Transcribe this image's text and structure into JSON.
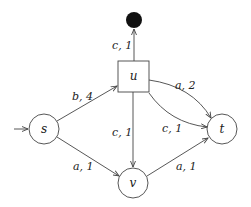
{
  "diagram": {
    "type": "weighted-directed-graph",
    "nodes": [
      {
        "id": "s",
        "label": "s",
        "shape": "circle",
        "initial": true
      },
      {
        "id": "u",
        "label": "u",
        "shape": "square"
      },
      {
        "id": "t",
        "label": "t",
        "shape": "circle"
      },
      {
        "id": "v",
        "label": "v",
        "shape": "circle"
      },
      {
        "id": "sink",
        "label": "",
        "shape": "filled-circle"
      }
    ],
    "edges": [
      {
        "from": "s",
        "to": "u",
        "label": "b, 4"
      },
      {
        "from": "s",
        "to": "v",
        "label": "a, 1"
      },
      {
        "from": "u",
        "to": "sink",
        "label": "c, 1"
      },
      {
        "from": "u",
        "to": "t",
        "label": "a, 2"
      },
      {
        "from": "u",
        "to": "t",
        "label": "c, 1"
      },
      {
        "from": "u",
        "to": "v",
        "label": "c, 1"
      },
      {
        "from": "v",
        "to": "t",
        "label": "a, 1"
      }
    ]
  },
  "labels": {
    "s": "s",
    "u": "u",
    "t": "t",
    "v": "v",
    "e_su": "b, 4",
    "e_sv": "a, 1",
    "e_usink": "c, 1",
    "e_ut_upper": "a, 2",
    "e_ut_lower": "c, 1",
    "e_uv": "c, 1",
    "e_vt": "a, 1"
  },
  "colors": {
    "stroke": "#444444",
    "sink_fill": "#111111",
    "background": "#ffffff"
  }
}
